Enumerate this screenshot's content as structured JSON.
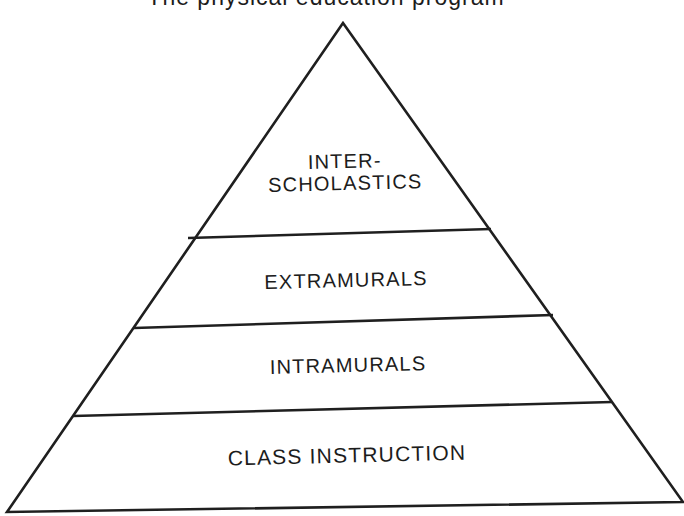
{
  "figure": {
    "title": "The physical education program",
    "background": "#ffffff",
    "line_color": "#1f1f1f",
    "text_color": "#1c1c1c"
  },
  "pyramid": {
    "type": "pyramid-diagram",
    "levels_top_to_bottom": [
      "INTER-SCHOLASTICS",
      "EXTRAMURALS",
      "INTRAMURALS",
      "CLASS INSTRUCTION"
    ],
    "levels": [
      {
        "rank": 1,
        "label": "INTER-\nSCHOLASTICS"
      },
      {
        "rank": 2,
        "label": "EXTRAMURALS"
      },
      {
        "rank": 3,
        "label": "INTRAMURALS"
      },
      {
        "rank": 4,
        "label": "CLASS INSTRUCTION"
      }
    ]
  }
}
